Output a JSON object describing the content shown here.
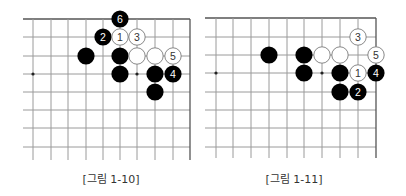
{
  "colors": {
    "grid_line": "#9a9a9a",
    "edge_line": "#555555",
    "black_stone": "#000000",
    "white_stone_fill": "#ffffff",
    "white_stone_stroke": "#7a7a7a",
    "black_stone_label": "#ffffff",
    "white_stone_label": "#333333",
    "star_point": "#222222",
    "caption": "#333333"
  },
  "diagrams": [
    {
      "id": "fig-1-10",
      "caption": "[그림 1-10]",
      "caption_center_x": 111,
      "grid": {
        "col_x": [
          33,
          51,
          68,
          86,
          103,
          120,
          137,
          155,
          173,
          190
        ],
        "row_y": [
          19,
          37,
          56,
          74,
          92,
          110,
          128,
          147
        ],
        "h_line_start_x": 23,
        "v_line_end_y": 160,
        "top_edge": true,
        "right_edge": true
      },
      "star_points": [
        {
          "col": 0,
          "row": 3
        },
        {
          "col": 6,
          "row": 3
        }
      ],
      "stones": [
        {
          "color": "black",
          "col": 5,
          "row": 0,
          "label": "6"
        },
        {
          "color": "black",
          "col": 4,
          "row": 1,
          "label": "2"
        },
        {
          "color": "white",
          "col": 5,
          "row": 1,
          "label": "1"
        },
        {
          "color": "white",
          "col": 6,
          "row": 1,
          "label": "3"
        },
        {
          "color": "black",
          "col": 3,
          "row": 2,
          "label": ""
        },
        {
          "color": "black",
          "col": 5,
          "row": 2,
          "label": ""
        },
        {
          "color": "white",
          "col": 6,
          "row": 2,
          "label": ""
        },
        {
          "color": "white",
          "col": 7,
          "row": 2,
          "label": ""
        },
        {
          "color": "white",
          "col": 8,
          "row": 2,
          "label": "5"
        },
        {
          "color": "black",
          "col": 5,
          "row": 3,
          "label": ""
        },
        {
          "color": "black",
          "col": 7,
          "row": 3,
          "label": ""
        },
        {
          "color": "black",
          "col": 8,
          "row": 3,
          "label": "4"
        },
        {
          "color": "black",
          "col": 7,
          "row": 4,
          "label": ""
        }
      ]
    },
    {
      "id": "fig-1-11",
      "caption": "[그림 1-11]",
      "caption_center_x": 294,
      "grid": {
        "col_x": [
          216,
          233,
          251,
          269,
          287,
          304,
          322,
          340,
          358,
          376
        ],
        "row_y": [
          18,
          37,
          55,
          73,
          92,
          110,
          128,
          147
        ],
        "h_line_start_x": 205,
        "v_line_end_y": 158,
        "top_edge": true,
        "right_edge": true
      },
      "star_points": [
        {
          "col": 0,
          "row": 3
        },
        {
          "col": 6,
          "row": 3
        }
      ],
      "stones": [
        {
          "color": "white",
          "col": 8,
          "row": 1,
          "label": "3"
        },
        {
          "color": "black",
          "col": 3,
          "row": 2,
          "label": ""
        },
        {
          "color": "black",
          "col": 5,
          "row": 2,
          "label": ""
        },
        {
          "color": "white",
          "col": 6,
          "row": 2,
          "label": ""
        },
        {
          "color": "white",
          "col": 7,
          "row": 2,
          "label": ""
        },
        {
          "color": "white",
          "col": 9,
          "row": 2,
          "label": "5"
        },
        {
          "color": "black",
          "col": 5,
          "row": 3,
          "label": ""
        },
        {
          "color": "black",
          "col": 7,
          "row": 3,
          "label": ""
        },
        {
          "color": "white",
          "col": 8,
          "row": 3,
          "label": "1"
        },
        {
          "color": "black",
          "col": 9,
          "row": 3,
          "label": "4"
        },
        {
          "color": "black",
          "col": 7,
          "row": 4,
          "label": ""
        },
        {
          "color": "black",
          "col": 8,
          "row": 4,
          "label": "2"
        }
      ]
    }
  ]
}
